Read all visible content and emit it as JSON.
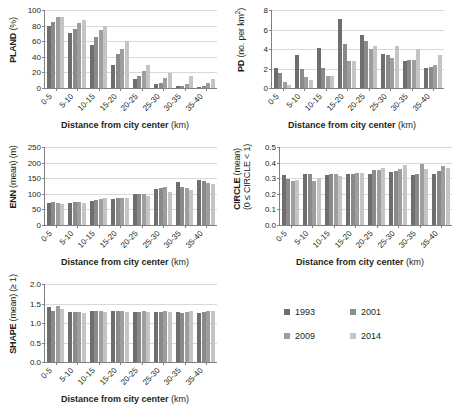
{
  "figure": {
    "shared_xlabel_bold": "Distance from city center",
    "shared_xlabel_unit": "(km)",
    "categories": [
      "0-5",
      "5-10",
      "10-15",
      "15-20",
      "20-25",
      "25-30",
      "30-35",
      "35-40"
    ]
  },
  "legend": {
    "position": "bottom-right",
    "items": [
      {
        "label": "1993",
        "color": "#6e6e6e"
      },
      {
        "label": "2001",
        "color": "#8a8a8a"
      },
      {
        "label": "2009",
        "color": "#9e9e9e"
      },
      {
        "label": "2014",
        "color": "#c4c4c4"
      }
    ]
  },
  "chart_data": [
    {
      "type": "bar",
      "id": "pland",
      "title": "",
      "xlabel": "Distance from city center (km)",
      "ylabel": "PLAND (%)",
      "ylabel_bold": "PLAND",
      "ylabel_unit": "(%)",
      "categories": [
        "0-5",
        "5-10",
        "10-15",
        "15-20",
        "20-25",
        "25-30",
        "30-35",
        "35-40"
      ],
      "ylim": [
        0,
        100
      ],
      "yticks": [
        0,
        20,
        40,
        60,
        80,
        100
      ],
      "grid": true,
      "series": [
        {
          "name": "1993",
          "values": [
            79,
            70,
            55,
            30,
            12,
            5,
            2,
            1
          ]
        },
        {
          "name": "2001",
          "values": [
            85,
            76,
            66,
            43,
            15,
            7,
            3,
            3
          ]
        },
        {
          "name": "2009",
          "values": [
            91,
            83,
            74,
            50,
            22,
            13,
            5,
            7
          ]
        },
        {
          "name": "2014",
          "values": [
            91,
            87,
            80,
            60,
            30,
            19,
            15,
            11
          ]
        }
      ]
    },
    {
      "type": "bar",
      "id": "pd",
      "title": "",
      "xlabel": "Distance from city center (km)",
      "ylabel": "PD (no. per km2)",
      "ylabel_bold": "PD",
      "ylabel_unit": "(no. per km²)",
      "categories": [
        "0-5",
        "5-10",
        "10-15",
        "15-20",
        "20-25",
        "25-30",
        "30-35",
        "35-40"
      ],
      "ylim": [
        0,
        8
      ],
      "yticks": [
        0,
        2,
        4,
        6,
        8
      ],
      "grid": true,
      "series": [
        {
          "name": "1993",
          "values": [
            2.1,
            3.4,
            4.1,
            7.1,
            5.45,
            3.45,
            2.75,
            2.1
          ]
        },
        {
          "name": "2001",
          "values": [
            1.55,
            1.9,
            2.1,
            4.5,
            4.8,
            3.4,
            2.85,
            2.2
          ]
        },
        {
          "name": "2009",
          "values": [
            0.6,
            1.1,
            1.2,
            2.8,
            4.0,
            3.05,
            2.9,
            2.35
          ]
        },
        {
          "name": "2014",
          "values": [
            0.35,
            0.8,
            1.2,
            2.75,
            4.35,
            4.3,
            4.0,
            3.35
          ]
        }
      ]
    },
    {
      "type": "bar",
      "id": "enn",
      "title": "",
      "xlabel": "Distance from city center (km)",
      "ylabel": "ENN (mean) (m)",
      "ylabel_bold": "ENN",
      "ylabel_unit": "(mean) (m)",
      "categories": [
        "0-5",
        "5-10",
        "10-15",
        "15-20",
        "20-25",
        "25-30",
        "30-35",
        "35-40"
      ],
      "ylim": [
        0,
        250
      ],
      "yticks": [
        0,
        50,
        100,
        150,
        200,
        250
      ],
      "grid": true,
      "series": [
        {
          "name": "1993",
          "values": [
            70,
            72,
            78,
            83,
            99,
            117,
            138,
            145
          ]
        },
        {
          "name": "2001",
          "values": [
            73,
            73,
            80,
            87,
            101,
            119,
            121,
            140
          ]
        },
        {
          "name": "2009",
          "values": [
            71,
            73,
            83,
            87,
            100,
            121,
            120,
            135
          ]
        },
        {
          "name": "2014",
          "values": [
            68,
            71,
            85,
            85,
            92,
            105,
            111,
            131
          ]
        }
      ]
    },
    {
      "type": "bar",
      "id": "circle",
      "title": "",
      "xlabel": "Distance from city center (km)",
      "ylabel": "CIRCLE (mean) (0 ≤ CIRCLE < 1)",
      "ylabel_bold": "CIRCLE",
      "ylabel_unit": "(mean)",
      "ylabel_line2": "(0 ≤ CIRCLE < 1)",
      "categories": [
        "0-5",
        "5-10",
        "10-15",
        "15-20",
        "20-25",
        "25-30",
        "30-35",
        "35-40"
      ],
      "ylim": [
        0,
        0.5
      ],
      "yticks": [
        0.0,
        0.1,
        0.2,
        0.3,
        0.4,
        0.5
      ],
      "ytick_labels": [
        "0.0",
        "0.1",
        "0.2",
        "0.3",
        "0.4",
        "0.5"
      ],
      "grid": true,
      "series": [
        {
          "name": "1993",
          "values": [
            0.32,
            0.325,
            0.32,
            0.325,
            0.33,
            0.34,
            0.32,
            0.33
          ]
        },
        {
          "name": "2001",
          "values": [
            0.295,
            0.325,
            0.33,
            0.33,
            0.35,
            0.345,
            0.325,
            0.345
          ]
        },
        {
          "name": "2009",
          "values": [
            0.285,
            0.285,
            0.325,
            0.335,
            0.355,
            0.36,
            0.39,
            0.38
          ]
        },
        {
          "name": "2014",
          "values": [
            0.29,
            0.3,
            0.315,
            0.335,
            0.365,
            0.385,
            0.36,
            0.365
          ]
        }
      ]
    },
    {
      "type": "bar",
      "id": "shape",
      "title": "",
      "xlabel": "Distance from city center (km)",
      "ylabel": "SHAPE (mean) (≥ 1)",
      "ylabel_bold": "SHAPE",
      "ylabel_unit": "(mean) (≥ 1)",
      "categories": [
        "0-5",
        "5-10",
        "10-15",
        "15-20",
        "20-25",
        "25-30",
        "30-35",
        "35-40"
      ],
      "ylim": [
        0,
        2.0
      ],
      "yticks": [
        0.0,
        0.5,
        1.0,
        1.5,
        2.0
      ],
      "ytick_labels": [
        "0.0",
        "0.5",
        "1.0",
        "1.5",
        "2.0"
      ],
      "grid": true,
      "series": [
        {
          "name": "1993",
          "values": [
            1.4,
            1.28,
            1.3,
            1.31,
            1.27,
            1.27,
            1.27,
            1.26
          ]
        },
        {
          "name": "2001",
          "values": [
            1.31,
            1.28,
            1.3,
            1.31,
            1.28,
            1.28,
            1.26,
            1.27
          ]
        },
        {
          "name": "2009",
          "values": [
            1.44,
            1.27,
            1.3,
            1.31,
            1.3,
            1.31,
            1.29,
            1.3
          ]
        },
        {
          "name": "2014",
          "values": [
            1.36,
            1.26,
            1.29,
            1.29,
            1.29,
            1.29,
            1.3,
            1.3
          ]
        }
      ]
    }
  ]
}
